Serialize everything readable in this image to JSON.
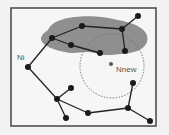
{
  "diagram": {
    "type": "graph-tree-sampling",
    "labels": {
      "ni": "Ni",
      "nnew": "Nnew"
    },
    "colors": {
      "background": "#f2f2f2",
      "frame": "#444444",
      "region": "#8f8f8f",
      "node": "#1a1a1a",
      "edge": "#222222",
      "circle": "#777777",
      "nnew_dot": "#555555"
    },
    "nodes": [
      {
        "id": "n1",
        "label": ""
      },
      {
        "id": "n2",
        "label": ""
      },
      {
        "id": "n3",
        "label": ""
      },
      {
        "id": "n4",
        "label": ""
      },
      {
        "id": "n5",
        "label": ""
      },
      {
        "id": "n6",
        "label": ""
      },
      {
        "id": "n7",
        "label": ""
      },
      {
        "id": "ni",
        "label": "Ni"
      },
      {
        "id": "n9",
        "label": ""
      },
      {
        "id": "n10",
        "label": ""
      },
      {
        "id": "n11",
        "label": ""
      },
      {
        "id": "n12",
        "label": ""
      },
      {
        "id": "n13",
        "label": ""
      },
      {
        "id": "n14",
        "label": ""
      },
      {
        "id": "n15",
        "label": ""
      }
    ],
    "edges": [
      [
        "n1",
        "n2"
      ],
      [
        "n2",
        "n3"
      ],
      [
        "n3",
        "n4"
      ],
      [
        "n4",
        "n5"
      ],
      [
        "n5",
        "n6"
      ],
      [
        "n2",
        "n7"
      ],
      [
        "n4",
        "ni"
      ],
      [
        "ni",
        "n10"
      ],
      [
        "n10",
        "n11"
      ],
      [
        "n10",
        "n12"
      ],
      [
        "n10",
        "n13"
      ],
      [
        "n13",
        "n14"
      ],
      [
        "n14",
        "n9"
      ],
      [
        "n14",
        "n15"
      ]
    ],
    "new_node": {
      "id": "nnew",
      "label": "Nnew"
    }
  }
}
